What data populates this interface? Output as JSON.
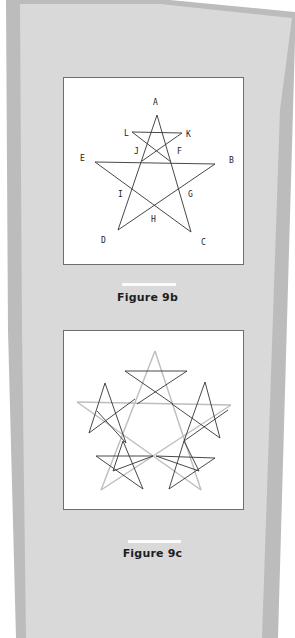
{
  "colors": {
    "outer_band": "#b9b9b9",
    "panel": "#d9d9d9",
    "box_border": "#6e6e6e",
    "dark_star": "#333333",
    "light_star": "#b8b8b8",
    "caption_rule": "#fbfbfb"
  },
  "figure_9b": {
    "caption": "Figure 9b",
    "labels": {
      "A": "A",
      "B": "B",
      "C": "C",
      "D": "D",
      "E": "E",
      "F": "F",
      "G": "G",
      "H": "H",
      "I": "I",
      "J": "J",
      "K": "K",
      "L": "L"
    }
  },
  "figure_9c": {
    "caption": "Figure 9c"
  }
}
